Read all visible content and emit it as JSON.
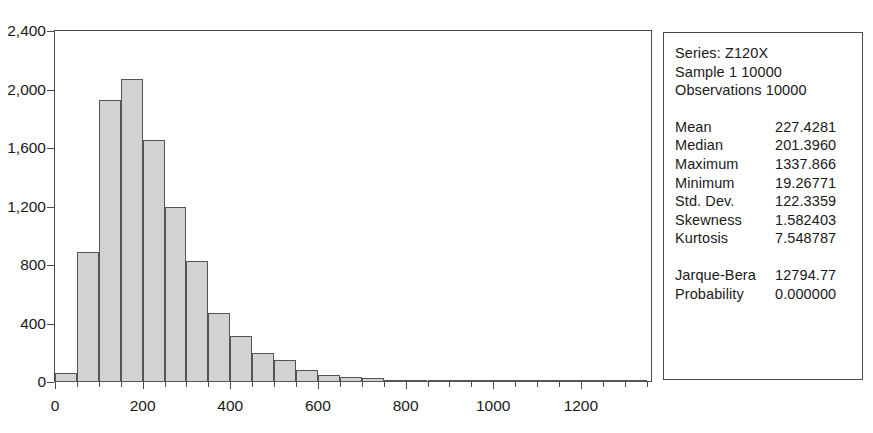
{
  "chart_data": {
    "type": "bar",
    "title": "",
    "xlabel": "",
    "ylabel": "",
    "xlim": [
      0,
      1360
    ],
    "ylim": [
      0,
      2400
    ],
    "bin_width": 50,
    "grid": false,
    "legend": false,
    "x_ticks": [
      "0",
      "200",
      "400",
      "600",
      "800",
      "1000",
      "1200"
    ],
    "x_tick_values": [
      0,
      200,
      400,
      600,
      800,
      1000,
      1200
    ],
    "y_ticks": [
      "0",
      "400",
      "800",
      "1,200",
      "1,600",
      "2,000",
      "2,400"
    ],
    "y_tick_values": [
      0,
      400,
      800,
      1200,
      1600,
      2000,
      2400
    ],
    "categories": [
      "0-50",
      "50-100",
      "100-150",
      "150-200",
      "200-250",
      "250-300",
      "300-350",
      "350-400",
      "400-450",
      "450-500",
      "500-550",
      "550-600",
      "600-650",
      "650-700",
      "700-750",
      "750-800",
      "800-850",
      "850-900",
      "900-950",
      "950-1000",
      "1000-1050",
      "1050-1100",
      "1100-1150",
      "1150-1200",
      "1200-1250",
      "1250-1300",
      "1300-1350"
    ],
    "bin_starts": [
      0,
      50,
      100,
      150,
      200,
      250,
      300,
      350,
      400,
      450,
      500,
      550,
      600,
      650,
      700,
      750,
      800,
      850,
      900,
      950,
      1000,
      1050,
      1100,
      1150,
      1200,
      1250,
      1300
    ],
    "values": [
      60,
      890,
      1930,
      2070,
      1655,
      1200,
      825,
      470,
      315,
      195,
      150,
      80,
      45,
      35,
      28,
      12,
      9,
      6,
      5,
      4,
      3,
      2,
      2,
      1,
      1,
      1,
      1
    ],
    "bar_fill_color": "#d2d2d2",
    "bar_edge_color": "#555555",
    "axis_color": "#4a4a4a"
  },
  "stats": {
    "header": [
      "Series: Z120X",
      "Sample 1 10000",
      "Observations 10000"
    ],
    "rows": [
      {
        "name": "Mean",
        "value": "227.4281"
      },
      {
        "name": "Median",
        "value": "201.3960"
      },
      {
        "name": "Maximum",
        "value": "1337.866"
      },
      {
        "name": "Minimum",
        "value": "19.26771"
      },
      {
        "name": "Std. Dev.",
        "value": "122.3359"
      },
      {
        "name": "Skewness",
        "value": "1.582403"
      },
      {
        "name": "Kurtosis",
        "value": "7.548787"
      }
    ],
    "test_rows": [
      {
        "name": "Jarque-Bera",
        "value": "12794.77"
      },
      {
        "name": "Probability",
        "value": "0.000000"
      }
    ]
  }
}
